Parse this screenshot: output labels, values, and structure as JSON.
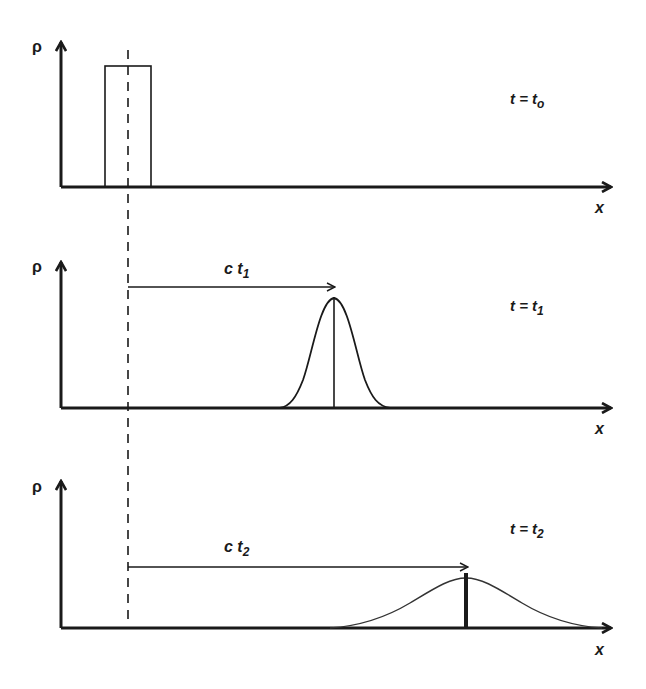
{
  "diagram": {
    "colors": {
      "ink": "#1a1a1a",
      "background": "#ffffff"
    },
    "reference_line": {
      "style": "dashed",
      "x": 128
    },
    "panels": [
      {
        "id": "t0",
        "y_axis_label": "ρ",
        "x_axis_label": "x",
        "time_label": {
          "main": "t = t",
          "sub": "o"
        },
        "profile": "rectangular pulse centered on reference line"
      },
      {
        "id": "t1",
        "y_axis_label": "ρ",
        "x_axis_label": "x",
        "time_label": {
          "main": "t = t",
          "sub": "1"
        },
        "displacement_label": {
          "main": "c t",
          "sub": "1"
        },
        "profile": "narrow gaussian with vertical centerline"
      },
      {
        "id": "t2",
        "y_axis_label": "ρ",
        "x_axis_label": "x",
        "time_label": {
          "main": "t = t",
          "sub": "2"
        },
        "displacement_label": {
          "main": "c t",
          "sub": "2"
        },
        "profile": "wide, lower gaussian with thick centerline"
      }
    ]
  }
}
